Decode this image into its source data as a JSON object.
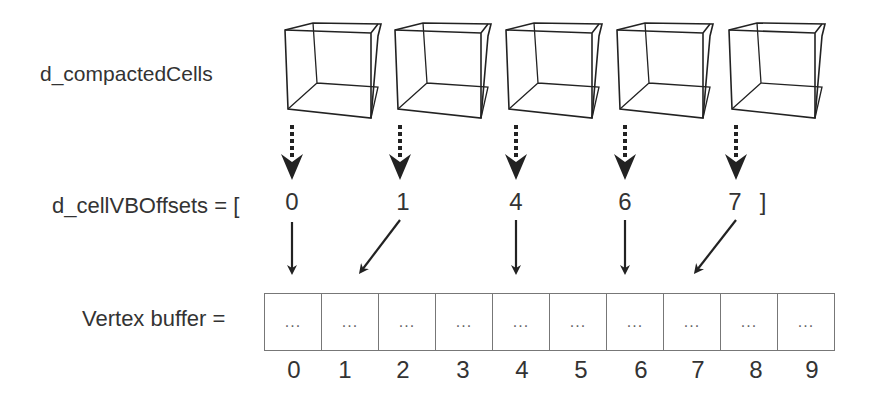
{
  "labels": {
    "cells": "d_compactedCells",
    "offsets_prefix": "d_cellVBOffsets = [",
    "offsets_suffix": "]",
    "buffer": "Vertex buffer ="
  },
  "offsets": [
    "0",
    "1",
    "4",
    "6",
    "7"
  ],
  "buffer_cells": [
    "...",
    "...",
    "...",
    "...",
    "...",
    "...",
    "...",
    "...",
    "...",
    "..."
  ],
  "buffer_indices": [
    "0",
    "1",
    "2",
    "3",
    "4",
    "5",
    "6",
    "7",
    "8",
    "9"
  ],
  "colors": {
    "line": "#222222",
    "cell_border": "#777777",
    "text": "#333333"
  }
}
